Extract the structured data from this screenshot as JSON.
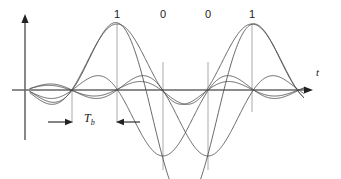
{
  "figure": {
    "axis": {
      "t_label": "t",
      "t_axis_name": "time",
      "vertical_axis_name": "amplitude"
    },
    "bit_labels": [
      {
        "text": "1",
        "x": 117
      },
      {
        "text": "0",
        "x": 163
      },
      {
        "text": "0",
        "x": 208
      },
      {
        "text": "1",
        "x": 252
      }
    ],
    "interval_marker": {
      "label": "T",
      "subscript": "b",
      "from_x": 72,
      "to_x": 117
    },
    "colors": {
      "axis": "#555555",
      "curve": "#4a4a4a",
      "gridline": "#9a9a9a",
      "text": "#1a1a1a",
      "background": "#ffffff"
    }
  },
  "chart_data": {
    "type": "line",
    "xlabel": "t",
    "ylabel": "",
    "grid": true,
    "legend_position": "none",
    "bit_sequence": [
      1,
      0,
      0,
      1
    ],
    "bit_period_label": "Tb",
    "sample_instants_x": [
      72,
      117,
      163,
      208,
      252,
      297
    ],
    "baseline_y": 90,
    "peak_y": 24,
    "trough_y": 168,
    "axis_origin_x": 25,
    "axis_top_y": 16,
    "axis_right_x": 312,
    "series": [
      {
        "name": "pulse-1-positive",
        "bit": 1,
        "center_x": 117,
        "amplitude": 1.0,
        "polarity": 1
      },
      {
        "name": "pulse-2-negative",
        "bit": 0,
        "center_x": 163,
        "amplitude": 1.0,
        "polarity": -1
      },
      {
        "name": "pulse-3-negative",
        "bit": 0,
        "center_x": 208,
        "amplitude": 1.0,
        "polarity": -1
      },
      {
        "name": "pulse-4-positive",
        "bit": 1,
        "center_x": 252,
        "amplitude": 1.0,
        "polarity": 1
      },
      {
        "name": "composite-sum",
        "bit": null,
        "center_x": null,
        "amplitude": 1.0,
        "polarity": 1
      }
    ]
  }
}
